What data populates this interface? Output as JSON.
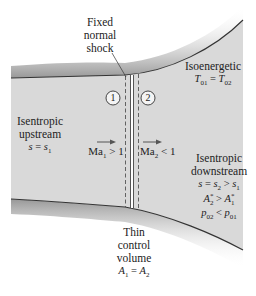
{
  "figure": {
    "type": "normal shock in a duct control volume",
    "colors": {
      "fluid_fill": "#d9d9d9",
      "wall_line": "#333333",
      "wall_shadow": "#9a9a9a",
      "background": "#ffffff",
      "shock_line": "#444444",
      "dashed_cv": "#555555"
    }
  },
  "labels": {
    "shock_label": {
      "line1": "Fixed",
      "line2": "normal",
      "line3": "shock"
    },
    "section1": "1",
    "section2": "2",
    "upstream": {
      "line1": "Isentropic",
      "line2": "upstream",
      "eq_lhs": "s",
      "eq_op": " = ",
      "eq_rhs": "s",
      "eq_sub": "1"
    },
    "mach_upstream": {
      "ma": "Ma",
      "sub": "1",
      "rel": " > 1"
    },
    "mach_downstream": {
      "ma": "Ma",
      "sub": "2",
      "rel": " < 1"
    },
    "isoenergetic": {
      "title": "Isoenergetic",
      "lhs": "T",
      "lhs_sub": "01",
      "op": " = ",
      "rhs": "T",
      "rhs_sub": "02"
    },
    "downstream": {
      "line1": "Isentropic",
      "line2": "downstream",
      "eq1": {
        "a": "s",
        "op1": " = ",
        "b": "s",
        "b_sub": "2",
        "op2": " > ",
        "c": "s",
        "c_sub": "1"
      },
      "eq2": {
        "a": "A",
        "a_sup": "*",
        "a_sub": "2",
        "op": " > ",
        "b": "A",
        "b_sup": "*",
        "b_sub": "1"
      },
      "eq3": {
        "a": "p",
        "a_sub": "02",
        "op": " < ",
        "b": "p",
        "b_sub": "01"
      }
    },
    "control_volume": {
      "line1": "Thin",
      "line2": "control",
      "line3": "volume",
      "a": "A",
      "a_sub": "1",
      "op": " = ",
      "b": "A",
      "b_sub": "2"
    }
  }
}
